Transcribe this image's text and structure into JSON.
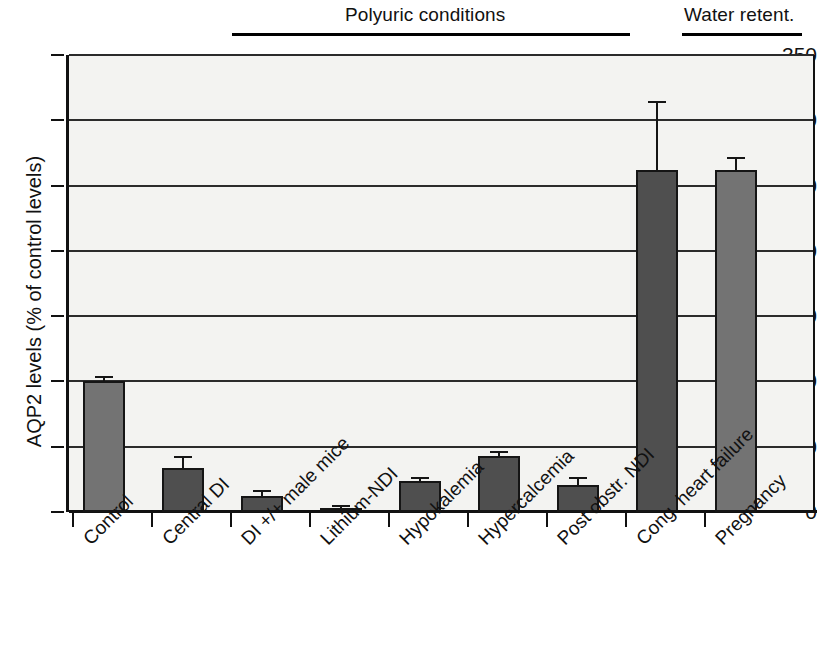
{
  "figure": {
    "ylabel": "AQP2 levels (% of control levels)",
    "groups": [
      {
        "label": "Polyuric conditions"
      },
      {
        "label": "Water retent."
      }
    ]
  },
  "chart_data": {
    "type": "bar",
    "title": "",
    "xlabel": "",
    "ylabel": "AQP2 levels (% of control levels)",
    "ylim": [
      0,
      350
    ],
    "yticks": [
      0,
      50,
      100,
      150,
      200,
      250,
      300,
      350
    ],
    "ytick_labels": [
      "0",
      "50",
      "100",
      "150",
      "200",
      "250",
      "300",
      "350"
    ],
    "grid": true,
    "legend": false,
    "categories": [
      "Control",
      "Central DI",
      "DI +/+ male mice",
      "Lithium-NDI",
      "Hypokalemia",
      "Hypercalcemia",
      "Post obstr. NDI",
      "Cong. heart failure",
      "Pregnancy"
    ],
    "values": [
      100,
      34,
      12,
      2,
      24,
      43,
      21,
      262,
      262
    ],
    "errors": [
      4,
      9,
      5,
      3,
      3,
      4,
      6,
      53,
      10
    ],
    "bar_styles": [
      "light",
      "dark",
      "dark",
      "dark",
      "dark",
      "dark",
      "dark",
      "dark",
      "light"
    ],
    "annotations": [
      {
        "text": "Polyuric conditions",
        "spans": [
          "Central DI",
          "Post obstr. NDI"
        ]
      },
      {
        "text": "Water retent.",
        "spans": [
          "Cong. heart failure",
          "Pregnancy"
        ]
      }
    ]
  }
}
